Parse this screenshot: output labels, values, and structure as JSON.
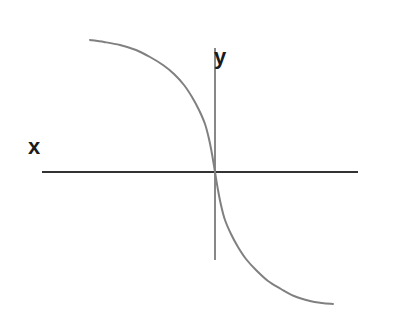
{
  "figure": {
    "width": 401,
    "height": 316,
    "background_color": "#ffffff"
  },
  "labels": {
    "x_axis": "x",
    "y_axis": "y"
  },
  "chart_data": {
    "type": "line",
    "title": "",
    "subtitle": "",
    "xlabel": "x",
    "ylabel": "y",
    "grid": false,
    "legend": null,
    "annotations": [],
    "axes": {
      "origin_px": [
        215,
        172
      ],
      "x_axis": {
        "label": "x",
        "label_position_px": [
          35,
          147
        ],
        "color": "#333333",
        "line_width_px": 2,
        "start_px": [
          42,
          172
        ],
        "end_px": [
          358,
          172
        ],
        "ticks": [],
        "tick_labels": []
      },
      "y_axis": {
        "label": "y",
        "label_position_px": [
          223,
          60
        ],
        "color": "#888888",
        "line_width_px": 2,
        "start_px": [
          215,
          48
        ],
        "end_px": [
          215,
          260
        ],
        "ticks": [],
        "tick_labels": []
      }
    },
    "series": [
      {
        "name": "curve",
        "color": "#808080",
        "line_width_px": 2,
        "description": "decreasing odd S-shaped curve through the origin",
        "points_px": [
          [
            90,
            40
          ],
          [
            104,
            42
          ],
          [
            120,
            45
          ],
          [
            136,
            50
          ],
          [
            150,
            57
          ],
          [
            163,
            65
          ],
          [
            174,
            74
          ],
          [
            184,
            85
          ],
          [
            192,
            97
          ],
          [
            199,
            110
          ],
          [
            205,
            124
          ],
          [
            209,
            139
          ],
          [
            212,
            154
          ],
          [
            215,
            172
          ],
          [
            218,
            190
          ],
          [
            221,
            205
          ],
          [
            225,
            220
          ],
          [
            231,
            234
          ],
          [
            238,
            247
          ],
          [
            246,
            259
          ],
          [
            256,
            270
          ],
          [
            268,
            281
          ],
          [
            281,
            289
          ],
          [
            294,
            296
          ],
          [
            310,
            301
          ],
          [
            322,
            303
          ],
          [
            333,
            304
          ]
        ]
      }
    ],
    "x": [
      -4,
      -3.5,
      -3,
      -2.5,
      -2,
      -1.5,
      -1,
      -0.5,
      0,
      0.5,
      1,
      1.5,
      2,
      2.5,
      3,
      3.5,
      4
    ],
    "values": [
      2.9,
      2.85,
      2.78,
      2.68,
      2.52,
      2.25,
      1.8,
      1.05,
      0,
      -1.05,
      -1.8,
      -2.25,
      -2.52,
      -2.68,
      -2.78,
      -2.85,
      -2.9
    ],
    "xlim": [
      -5.5,
      4.5
    ],
    "ylim": [
      -3.4,
      3.4
    ]
  }
}
